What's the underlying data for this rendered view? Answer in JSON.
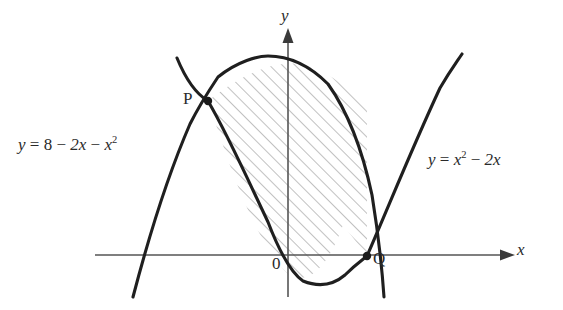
{
  "figure": {
    "background_color": "#ffffff",
    "ink_color": "#1a1a1a",
    "hatch_color": "#8a8a8a",
    "axis_color": "#555555"
  },
  "axes": {
    "x_label": "x",
    "y_label": "y",
    "origin_label": "0",
    "origin_px": {
      "x": 288,
      "y": 255
    },
    "x_axis_y_px": 255,
    "y_axis_x_px": 288,
    "px_per_unit_x": 40,
    "px_per_unit_y": 19,
    "x_arrow": "arrow-right",
    "y_arrow": "arrow-up"
  },
  "curves": [
    {
      "name": "downward-parabola",
      "label_text": "y = 8 − 2x − x",
      "label_parts": {
        "lhs": "y",
        "eq": "=",
        "c": "8",
        "minus1": "−",
        "t1": "2x",
        "minus2": "−",
        "t2": "x",
        "exp2": "2"
      },
      "equation": "y = 8 - 2x - x^2",
      "vertex": {
        "x": -1,
        "y": 9
      },
      "roots": [
        -4,
        2
      ]
    },
    {
      "name": "upward-parabola",
      "label_text": "y = x² − 2x",
      "label_parts": {
        "lhs": "y",
        "eq": "=",
        "t1": "x",
        "exp1": "2",
        "minus1": "−",
        "t2": "2x"
      },
      "equation": "y = x^2 - 2x",
      "vertex": {
        "x": 1,
        "y": -1
      },
      "roots": [
        0,
        2
      ]
    }
  ],
  "points": [
    {
      "name": "P",
      "label": "P",
      "coords": {
        "x": -2,
        "y": 8
      },
      "px": {
        "x": 208,
        "y": 101
      }
    },
    {
      "name": "Q",
      "label": "Q",
      "coords": {
        "x": 2,
        "y": 0
      },
      "px": {
        "x": 367,
        "y": 256
      }
    }
  ],
  "shaded_region": {
    "name": "region-between-curves",
    "fill": "diagonal-hatch",
    "hatch_angle_deg": 45,
    "bounded_by": [
      "downward-parabola",
      "upward-parabola"
    ],
    "from_point": "P",
    "to_point": "Q"
  }
}
